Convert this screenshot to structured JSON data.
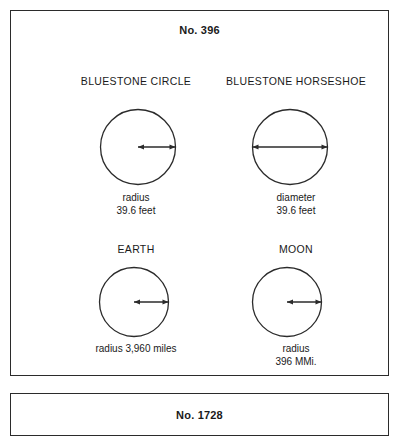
{
  "page": {
    "background_color": "#ffffff",
    "stroke_color": "#2b2b2b"
  },
  "main_panel": {
    "title": "No. 396",
    "figures": [
      {
        "name": "bluestone-circle",
        "heading": "BLUESTONE CIRCLE",
        "measure_type": "radius",
        "caption_line1": "radius",
        "caption_line2": "39.6 feet",
        "circle_diameter_px": 76
      },
      {
        "name": "bluestone-horseshoe",
        "heading": "BLUESTONE HORSESHOE",
        "measure_type": "diameter",
        "caption_line1": "diameter",
        "caption_line2": "39.6 feet",
        "circle_diameter_px": 76
      },
      {
        "name": "earth",
        "heading": "EARTH",
        "measure_type": "radius",
        "caption_line1": "radius 3,960 miles",
        "caption_line2": "",
        "circle_diameter_px": 70
      },
      {
        "name": "moon",
        "heading": "MOON",
        "measure_type": "radius",
        "caption_line1": "radius",
        "caption_line2": "396 MMi.",
        "circle_diameter_px": 70
      }
    ]
  },
  "next_panel": {
    "title": "No. 1728"
  }
}
